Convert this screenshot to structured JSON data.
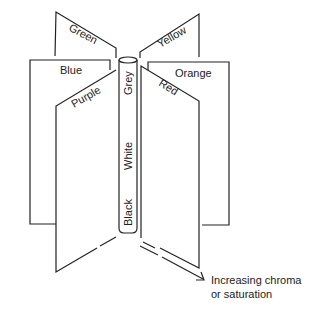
{
  "diagram": {
    "title": "",
    "hue_panels": {
      "left_back": "Green",
      "left_middle": "Blue",
      "left_front": "Purple",
      "right_back": "Yellow",
      "right_middle": "Orange",
      "right_front": "Red"
    },
    "axis_labels": {
      "top": "Grey",
      "middle": "White",
      "bottom": "Black"
    },
    "arrow_caption": {
      "line1": "Increasing chroma",
      "line2": "or saturation"
    },
    "colors": {
      "line": "#222222",
      "background": "#ffffff"
    }
  }
}
